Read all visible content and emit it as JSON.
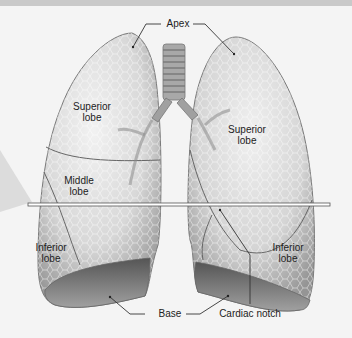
{
  "diagram": {
    "labels": {
      "apex": "Apex",
      "superior_lobe_right": "Superior\nlobe",
      "superior_lobe_left": "Superior\nlobe",
      "middle_lobe": "Middle\nlobe",
      "inferior_lobe_right": "Inferior\nlobe",
      "inferior_lobe_left": "Inferior\nlobe",
      "base": "Base",
      "cardiac_notch": "Cardiac notch"
    }
  }
}
